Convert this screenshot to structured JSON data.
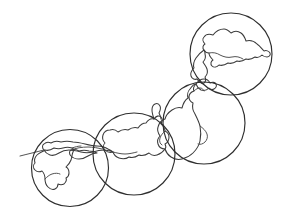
{
  "figure": {
    "background_color": "#ffffff",
    "line_color": "#3b3b3b",
    "circle_color": "#2f2f2f",
    "width": 282,
    "height": 221,
    "style": "hand-drawn line art, no fill, no labels"
  },
  "chart_data": {
    "type": "diagram",
    "title": "",
    "xlabel": "",
    "ylabel": "",
    "grid": false,
    "legend": "none",
    "annotations": [],
    "circles": [
      {
        "id": "circle-kyushu",
        "label": "",
        "cx": 70,
        "cy": 168,
        "r": 38.5,
        "order": 1
      },
      {
        "id": "circle-chugoku",
        "label": "",
        "cx": 134,
        "cy": 154,
        "r": 41.0,
        "order": 2
      },
      {
        "id": "circle-tohoku",
        "label": "",
        "cx": 204,
        "cy": 123,
        "r": 41.0,
        "order": 3
      },
      {
        "id": "circle-hokkaido",
        "label": "",
        "cx": 231,
        "cy": 54,
        "r": 41.0,
        "order": 4
      }
    ],
    "landmasses": [
      {
        "id": "hokkaido",
        "label": "",
        "region": "north"
      },
      {
        "id": "honshu",
        "label": "",
        "region": "main"
      },
      {
        "id": "shikoku",
        "label": "",
        "region": "south"
      },
      {
        "id": "kyushu",
        "label": "",
        "region": "southwest"
      }
    ]
  }
}
